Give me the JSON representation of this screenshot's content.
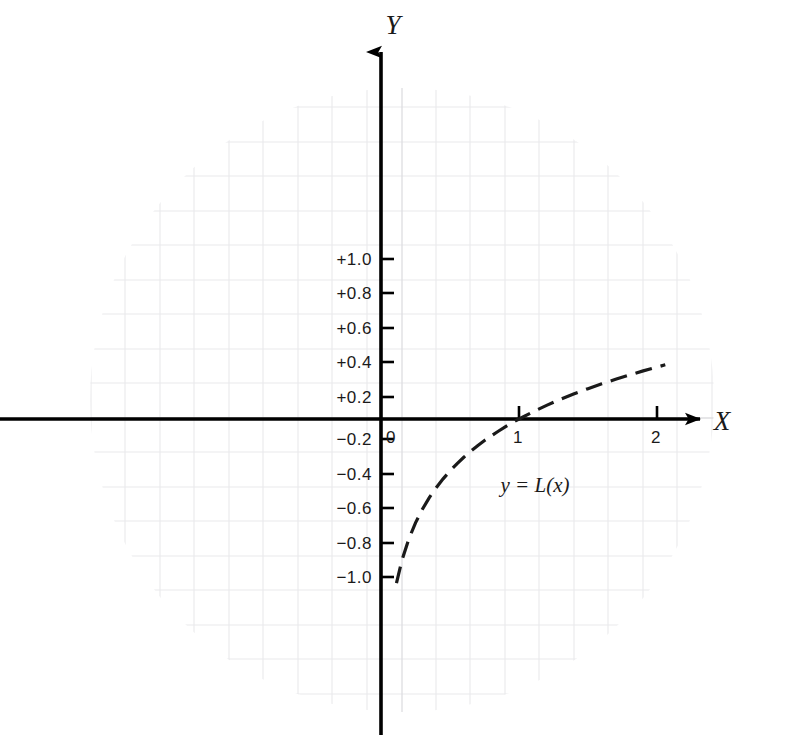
{
  "chart_data": {
    "type": "line",
    "title": "",
    "subtitle": "",
    "xlabel": "X",
    "ylabel": "Y",
    "annotation": "y = L(x)",
    "function": "y = log10(x)",
    "grid": true,
    "grid_style": "faint graph paper background, circular scan mask",
    "legend_position": "none",
    "xlim": [
      -2.75,
      2.95
    ],
    "ylim": [
      -1.95,
      2.1
    ],
    "xticks": [
      {
        "value": 0,
        "label": "0"
      },
      {
        "value": 1,
        "label": "1"
      },
      {
        "value": 2,
        "label": "2"
      }
    ],
    "yticks": [
      {
        "value": 1.0,
        "label": "+1.0"
      },
      {
        "value": 0.8,
        "label": "+0.8"
      },
      {
        "value": 0.6,
        "label": "+0.6"
      },
      {
        "value": 0.4,
        "label": "+0.4"
      },
      {
        "value": 0.2,
        "label": "+0.2"
      },
      {
        "value": -0.2,
        "label": "−0.2"
      },
      {
        "value": -0.4,
        "label": "−0.4"
      },
      {
        "value": -0.6,
        "label": "−0.6"
      },
      {
        "value": -0.8,
        "label": "−0.8"
      },
      {
        "value": -1.0,
        "label": "−1.0"
      }
    ],
    "x": [
      0.112,
      0.15,
      0.2,
      0.25,
      0.3,
      0.35,
      0.4,
      0.45,
      0.5,
      0.55,
      0.6,
      0.65,
      0.7,
      0.75,
      0.8,
      0.85,
      0.9,
      0.95,
      1.0,
      1.1,
      1.2,
      1.3,
      1.4,
      1.5,
      1.6,
      1.7,
      1.8,
      1.9,
      2.0,
      2.06
    ],
    "y": [
      -0.951,
      -0.824,
      -0.699,
      -0.602,
      -0.523,
      -0.456,
      -0.398,
      -0.347,
      -0.301,
      -0.26,
      -0.222,
      -0.187,
      -0.155,
      -0.125,
      -0.097,
      -0.071,
      -0.046,
      -0.022,
      0.0,
      0.041,
      0.079,
      0.114,
      0.146,
      0.176,
      0.204,
      0.23,
      0.255,
      0.279,
      0.301,
      0.314
    ],
    "colors": {
      "curve": "#1a1a1a",
      "axis": "#000000",
      "grid": "#e8e8ea",
      "text": "#1a1a1a",
      "background": "#ffffff"
    }
  }
}
